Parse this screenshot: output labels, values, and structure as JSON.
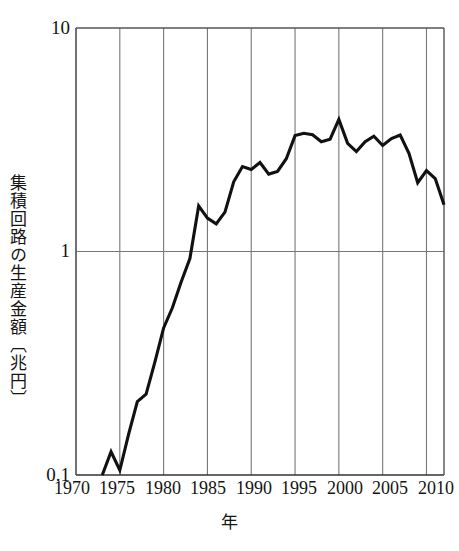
{
  "chart_data": {
    "type": "line",
    "title": "",
    "xlabel": "年",
    "ylabel": "集積回路の生産金額〔兆円〕",
    "yscale": "log",
    "ylim": [
      0.1,
      10
    ],
    "xlim": [
      1970,
      2012
    ],
    "grid": true,
    "legend": null,
    "y_tick_labels": [
      "10",
      "1",
      "0.1"
    ],
    "y_tick_values": [
      10,
      1,
      0.1
    ],
    "x_tick_labels": [
      "1970",
      "1975",
      "1980",
      "1985",
      "1990",
      "1995",
      "2000",
      "2005",
      "2010"
    ],
    "x_tick_values": [
      1970,
      1975,
      1980,
      1985,
      1990,
      1995,
      2000,
      2005,
      2010
    ],
    "line_color": "#111111",
    "grid_color": "#777777",
    "series": [
      {
        "name": "集積回路の生産金額",
        "x": [
          1973,
          1974,
          1975,
          1976,
          1977,
          1978,
          1979,
          1980,
          1981,
          1982,
          1983,
          1984,
          1985,
          1986,
          1987,
          1988,
          1989,
          1990,
          1991,
          1992,
          1993,
          1994,
          1995,
          1996,
          1997,
          1998,
          1999,
          2000,
          2001,
          2002,
          2003,
          2004,
          2005,
          2006,
          2007,
          2008,
          2009,
          2010,
          2011,
          2012
        ],
        "values": [
          0.1,
          0.127,
          0.105,
          0.152,
          0.213,
          0.23,
          0.32,
          0.455,
          0.56,
          0.73,
          0.93,
          1.6,
          1.41,
          1.33,
          1.5,
          2.05,
          2.4,
          2.33,
          2.5,
          2.22,
          2.28,
          2.6,
          3.3,
          3.38,
          3.33,
          3.1,
          3.18,
          3.9,
          3.05,
          2.8,
          3.1,
          3.28,
          2.98,
          3.2,
          3.32,
          2.75,
          2.03,
          2.3,
          2.12,
          1.62
        ]
      }
    ]
  },
  "axes": {
    "y_title": "集積回路の生産金額〔兆円〕",
    "x_title": "年"
  }
}
